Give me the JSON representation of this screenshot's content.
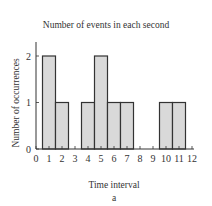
{
  "chart_data": {
    "type": "bar",
    "title": "Number of events in each second",
    "xlabel": "Time interval",
    "ylabel": "Number of occurrences",
    "caption": "a",
    "categories": [
      1,
      2,
      3,
      4,
      5,
      6,
      7,
      8,
      9,
      10,
      11
    ],
    "values": [
      2,
      1,
      0,
      1,
      2,
      1,
      1,
      0,
      0,
      1,
      1
    ],
    "xticks": [
      0,
      1,
      2,
      3,
      4,
      5,
      6,
      7,
      8,
      9,
      10,
      11,
      12
    ],
    "yticks": [
      0,
      1,
      2
    ],
    "xlim": [
      0,
      12
    ],
    "ylim": [
      0,
      2.3
    ],
    "grid": false,
    "bar_color": "#d9d9d9",
    "edge_color": "#333333"
  }
}
